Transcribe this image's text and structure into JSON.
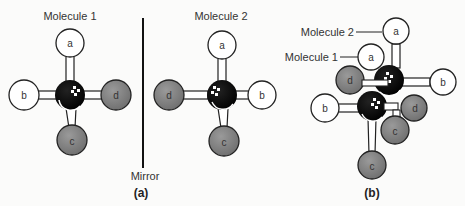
{
  "figure": {
    "panel_a": {
      "caption": "(a)",
      "molecule1": {
        "label": "Molecule 1",
        "center": {
          "x": 70,
          "y": 95
        },
        "atoms": [
          {
            "id": "a",
            "label": "a",
            "x": 70,
            "y": 43,
            "shade": "white"
          },
          {
            "id": "b",
            "label": "b",
            "x": 24,
            "y": 95,
            "shade": "white"
          },
          {
            "id": "d",
            "label": "d",
            "x": 116,
            "y": 95,
            "shade": "gray"
          },
          {
            "id": "c",
            "label": "c",
            "x": 72,
            "y": 140,
            "shade": "gray"
          }
        ]
      },
      "mirror_label": "Mirror",
      "molecule2": {
        "label": "Molecule 2",
        "center": {
          "x": 222,
          "y": 95
        },
        "atoms": [
          {
            "id": "a",
            "label": "a",
            "x": 222,
            "y": 45,
            "shade": "white"
          },
          {
            "id": "d",
            "label": "d",
            "x": 169,
            "y": 95,
            "shade": "gray"
          },
          {
            "id": "b",
            "label": "b",
            "x": 262,
            "y": 95,
            "shade": "white"
          },
          {
            "id": "c",
            "label": "c",
            "x": 224,
            "y": 141,
            "shade": "gray"
          }
        ]
      }
    },
    "panel_b": {
      "caption": "(b)",
      "molecule2_label": "Molecule 2",
      "molecule1_label": "Molecule 1",
      "atom_labels": {
        "m2_a": "a",
        "m2_b": "b",
        "m2_d": "d",
        "m2_c": "c",
        "m1_a": "a",
        "m1_b": "b",
        "m1_d": "d",
        "m1_c": "c"
      }
    },
    "colors": {
      "white_atom": "#ffffff",
      "gray_atom": "#8a8a8a",
      "carbon": "#0a0a0a",
      "outline": "#222222",
      "bond": "#ffffff"
    }
  }
}
